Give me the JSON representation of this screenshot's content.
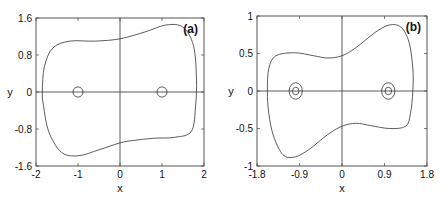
{
  "chart_data": [
    {
      "type": "line",
      "panel_label": "(a)",
      "title": "",
      "xlabel": "x",
      "ylabel": "y",
      "xlim": [
        -2,
        2
      ],
      "ylim": [
        -1.6,
        1.6
      ],
      "xticks": [
        -2,
        -1,
        0,
        1,
        2
      ],
      "xtick_labels": [
        "-2",
        "-1",
        "0",
        "1",
        "2"
      ],
      "yticks": [
        -1.6,
        -0.8,
        0,
        0.8,
        1.6
      ],
      "ytick_labels": [
        "-1.6",
        "-0.8",
        "0",
        "0.8",
        "1.6"
      ],
      "grid": false,
      "zero_lines": true,
      "series": [
        {
          "name": "outer closed orbit",
          "points": [
            [
              -1.85,
              0
            ],
            [
              -1.8,
              0.55
            ],
            [
              -1.6,
              0.95
            ],
            [
              -1.2,
              1.1
            ],
            [
              -0.6,
              1.1
            ],
            [
              0,
              1.15
            ],
            [
              0.6,
              1.3
            ],
            [
              1.1,
              1.45
            ],
            [
              1.5,
              1.4
            ],
            [
              1.75,
              1.0
            ],
            [
              1.82,
              0.3
            ],
            [
              1.8,
              -0.3
            ],
            [
              1.7,
              -0.85
            ],
            [
              1.3,
              -0.98
            ],
            [
              0.8,
              -1.0
            ],
            [
              0.3,
              -1.05
            ],
            [
              0,
              -1.1
            ],
            [
              -0.5,
              -1.25
            ],
            [
              -1.0,
              -1.38
            ],
            [
              -1.4,
              -1.3
            ],
            [
              -1.7,
              -0.85
            ],
            [
              -1.82,
              -0.3
            ],
            [
              -1.85,
              0
            ]
          ]
        }
      ],
      "small_orbits": [
        {
          "cx": -1,
          "cy": 0,
          "rx": 0.12,
          "ry": 0.11
        },
        {
          "cx": 1,
          "cy": 0,
          "rx": 0.12,
          "ry": 0.11
        }
      ]
    },
    {
      "type": "line",
      "panel_label": "(b)",
      "title": "",
      "xlabel": "x",
      "ylabel": "y",
      "xlim": [
        -1.8,
        1.8
      ],
      "ylim": [
        -1,
        1
      ],
      "xticks": [
        -1.8,
        -0.9,
        0,
        0.9,
        1.8
      ],
      "xtick_labels": [
        "-1.8",
        "-0.9",
        "0",
        "0.9",
        "1.8"
      ],
      "yticks": [
        -1,
        -0.5,
        0,
        0.5,
        1
      ],
      "ytick_labels": [
        "-1",
        "-0.5",
        "0",
        "0.5",
        "1"
      ],
      "grid": false,
      "zero_lines": true,
      "series": [
        {
          "name": "outer closed orbit",
          "points": [
            [
              -1.58,
              0
            ],
            [
              -1.55,
              0.3
            ],
            [
              -1.4,
              0.47
            ],
            [
              -1.0,
              0.51
            ],
            [
              -0.6,
              0.47
            ],
            [
              -0.3,
              0.44
            ],
            [
              0,
              0.47
            ],
            [
              0.3,
              0.58
            ],
            [
              0.7,
              0.78
            ],
            [
              1.0,
              0.88
            ],
            [
              1.25,
              0.85
            ],
            [
              1.42,
              0.65
            ],
            [
              1.5,
              0.3
            ],
            [
              1.5,
              0
            ],
            [
              1.45,
              -0.3
            ],
            [
              1.35,
              -0.47
            ],
            [
              1.0,
              -0.5
            ],
            [
              0.6,
              -0.46
            ],
            [
              0.3,
              -0.43
            ],
            [
              0,
              -0.47
            ],
            [
              -0.3,
              -0.58
            ],
            [
              -0.7,
              -0.78
            ],
            [
              -1.0,
              -0.88
            ],
            [
              -1.25,
              -0.85
            ],
            [
              -1.45,
              -0.6
            ],
            [
              -1.55,
              -0.3
            ],
            [
              -1.58,
              0
            ]
          ]
        }
      ],
      "small_orbits": [
        {
          "cx": -0.98,
          "cy": 0,
          "rx": 0.14,
          "ry": 0.11
        },
        {
          "cx": -0.98,
          "cy": 0,
          "rx": 0.07,
          "ry": 0.05
        },
        {
          "cx": 0.98,
          "cy": 0,
          "rx": 0.14,
          "ry": 0.11
        },
        {
          "cx": 0.98,
          "cy": 0,
          "rx": 0.07,
          "ry": 0.05
        }
      ]
    }
  ],
  "layout": {
    "panels": [
      {
        "left": 36,
        "top": 18,
        "right": 204,
        "bottom": 166
      },
      {
        "left": 257,
        "top": 16,
        "right": 427,
        "bottom": 166
      }
    ]
  }
}
